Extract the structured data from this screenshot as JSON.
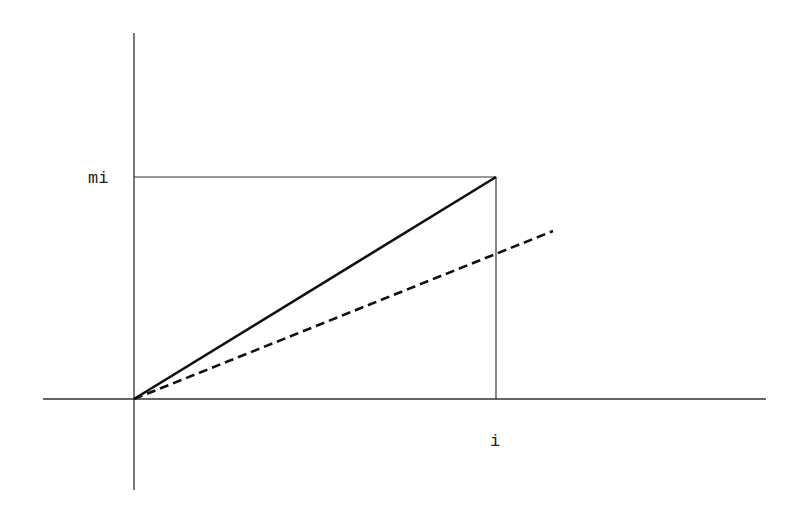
{
  "diagram": {
    "labels": {
      "y_mark": "mi",
      "x_mark": "i"
    },
    "geometry": {
      "y_axis": {
        "x": 134,
        "y1": 33,
        "y2": 490
      },
      "x_axis": {
        "y": 399,
        "x1": 43,
        "x2": 766
      },
      "origin": {
        "x": 134,
        "y": 399
      },
      "corner": {
        "x": 496,
        "y": 177
      },
      "dashed_end": {
        "x": 553,
        "y": 231
      }
    },
    "lines": [
      {
        "name": "solid-line",
        "style": "solid",
        "from": "origin",
        "to": "corner"
      },
      {
        "name": "dashed-line",
        "style": "dashed",
        "from": "origin",
        "to": "dashed_end"
      },
      {
        "name": "guide-horizontal",
        "style": "thin",
        "from": "y_axis at mi",
        "to": "corner"
      },
      {
        "name": "guide-vertical",
        "style": "thin",
        "from": "corner",
        "to": "x_axis at i"
      }
    ],
    "colors": {
      "axis": "#333333",
      "line": "#111111",
      "background": "#ffffff"
    }
  }
}
